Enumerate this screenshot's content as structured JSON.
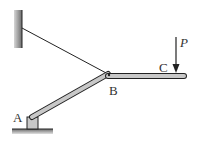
{
  "diagram": {
    "title": "",
    "labels": {
      "A": "A",
      "B": "B",
      "C": "C",
      "P": "P"
    },
    "elements": {
      "wall": "fixed wall support",
      "cable": "cable from wall to B",
      "bar_AB": "inclined bar A to B",
      "bar_BC": "horizontal bar B to C",
      "support_A": "pin support at A",
      "load_P": "downward force P at C"
    },
    "colors": {
      "line": "#222222",
      "bar_fill": "#c8c8c8",
      "wall_fill": "#7a7a7a"
    }
  }
}
